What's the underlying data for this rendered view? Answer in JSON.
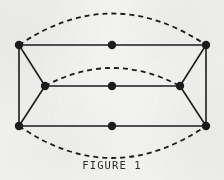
{
  "figure": {
    "caption": "FIGURE 1",
    "background_color": "#f3f3f1",
    "ink_color": "#1c1c1c",
    "canvas": {
      "width": 224,
      "height": 180
    }
  },
  "diagram": {
    "type": "graph",
    "vertex_radius": 4.2,
    "edge_width": 1.6,
    "dash_width": 1.8,
    "dash_pattern": "5 4",
    "vertices": [
      {
        "id": "v-top-left",
        "name": "top-left-vertex",
        "x": 19,
        "y": 45
      },
      {
        "id": "v-top-mid",
        "name": "top-middle-vertex",
        "x": 112,
        "y": 45
      },
      {
        "id": "v-top-right",
        "name": "top-right-vertex",
        "x": 206,
        "y": 45
      },
      {
        "id": "v-center-left",
        "name": "center-left-vertex",
        "x": 45,
        "y": 86
      },
      {
        "id": "v-center-mid",
        "name": "center-middle-vertex",
        "x": 112,
        "y": 86
      },
      {
        "id": "v-center-right",
        "name": "center-right-vertex",
        "x": 180,
        "y": 86
      },
      {
        "id": "v-bottom-left",
        "name": "bottom-left-vertex",
        "x": 19,
        "y": 126
      },
      {
        "id": "v-bottom-mid",
        "name": "bottom-middle-vertex",
        "x": 112,
        "y": 126
      },
      {
        "id": "v-bottom-right",
        "name": "bottom-right-vertex",
        "x": 206,
        "y": 126
      }
    ],
    "solid_edges": [
      {
        "name": "edge-top-horizontal",
        "x1": 19,
        "y1": 45,
        "x2": 206,
        "y2": 45
      },
      {
        "name": "edge-center-horizontal",
        "x1": 45,
        "y1": 86,
        "x2": 180,
        "y2": 86
      },
      {
        "name": "edge-bottom-horizontal",
        "x1": 19,
        "y1": 126,
        "x2": 206,
        "y2": 126
      },
      {
        "name": "edge-left-vertical",
        "x1": 19,
        "y1": 45,
        "x2": 19,
        "y2": 126
      },
      {
        "name": "edge-right-vertical",
        "x1": 206,
        "y1": 45,
        "x2": 206,
        "y2": 126
      },
      {
        "name": "edge-top-left-to-center",
        "x1": 19,
        "y1": 45,
        "x2": 45,
        "y2": 86
      },
      {
        "name": "edge-top-right-to-center",
        "x1": 206,
        "y1": 45,
        "x2": 180,
        "y2": 86
      },
      {
        "name": "edge-bottom-left-to-center",
        "x1": 19,
        "y1": 126,
        "x2": 45,
        "y2": 86
      },
      {
        "name": "edge-bottom-right-to-center",
        "x1": 206,
        "y1": 126,
        "x2": 180,
        "y2": 86
      }
    ],
    "dashed_arcs": [
      {
        "name": "outer-upper-arc",
        "path": "M 19 45 Q 112 -18 206 45",
        "note": "upper half of the large dashed ellipse joining the two top corner vertices"
      },
      {
        "name": "outer-lower-arc",
        "path": "M 19 126 Q 112 190 206 126",
        "note": "lower half of the large dashed ellipse joining the two bottom corner vertices"
      },
      {
        "name": "inner-upper-arc",
        "path": "M 45 86 Q 112 50 180 86",
        "note": "small dashed arc joining the two center side vertices"
      }
    ]
  }
}
